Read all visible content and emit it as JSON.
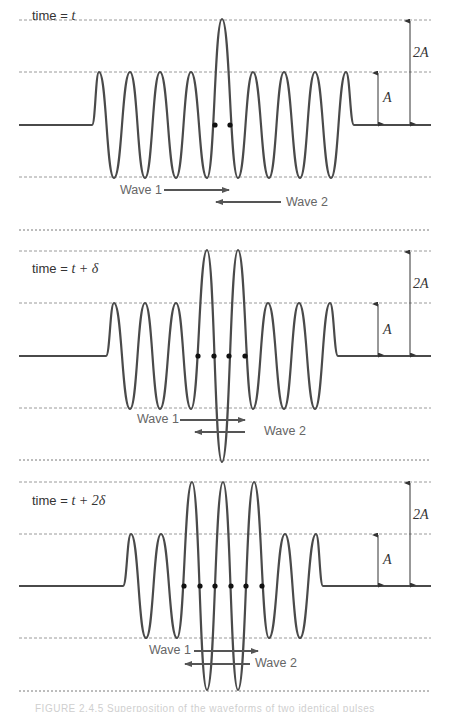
{
  "figure": {
    "colors": {
      "wave": "#4a4a4a",
      "dashed": "#9a9a9a",
      "separator": "#7a7a7a",
      "arrow": "#555555",
      "dot": "#111111",
      "dim": "#333333"
    },
    "x_left": 19,
    "x_right": 431,
    "dim_arrow_A_x": 378,
    "dim_arrow_2A_x": 410,
    "separators_y": [
      230
    ],
    "caption": "FIGURE 2.4.5 Superposition of the waveforms of two identical pulses"
  },
  "panels": [
    {
      "id": "panel-1",
      "time_prefix": "time = ",
      "time_math": "t",
      "time_label_pos": [
        32,
        8
      ],
      "lines_y": {
        "plus2A": 20,
        "plusA": 72,
        "base": 125,
        "minusA": 177,
        "minus2A": null
      },
      "wave_start": 92,
      "wave_end": 354,
      "extrema": [
        [
          99,
          1
        ],
        [
          114,
          -1
        ],
        [
          130,
          1
        ],
        [
          145,
          -1
        ],
        [
          160,
          1
        ],
        [
          176,
          -1
        ],
        [
          191,
          1
        ],
        [
          207,
          -1
        ],
        [
          222,
          2
        ],
        [
          238,
          -1
        ],
        [
          253,
          1
        ],
        [
          269,
          -1
        ],
        [
          284,
          1
        ],
        [
          300,
          -1
        ],
        [
          315,
          1
        ],
        [
          331,
          -1
        ],
        [
          346,
          1
        ]
      ],
      "dots_x": [
        215,
        230
      ],
      "wave1": {
        "label": "Wave 1",
        "label_pos": [
          120,
          183
        ],
        "arrow": [
          164,
          229,
          190
        ]
      },
      "wave2": {
        "label": "Wave 2",
        "label_pos": [
          286,
          195
        ],
        "arrow": [
          281,
          216,
          202
        ]
      },
      "dim_labels": {
        "A": "A",
        "A_pos": [
          383,
          90
        ],
        "twoA": "2A",
        "twoA_pos": [
          413,
          45
        ]
      }
    },
    {
      "id": "panel-2",
      "time_prefix": "time = ",
      "time_math": "t + δ",
      "time_label_pos": [
        32,
        261
      ],
      "lines_y": {
        "plus2A": 251,
        "plusA": 303,
        "base": 356,
        "minusA": 408,
        "minus2A": 460
      },
      "wave_start": 106,
      "wave_end": 338,
      "extrema": [
        [
          114,
          1
        ],
        [
          130,
          -1
        ],
        [
          145,
          1
        ],
        [
          160,
          -1
        ],
        [
          176,
          1
        ],
        [
          191,
          -1
        ],
        [
          207,
          2
        ],
        [
          222,
          -2
        ],
        [
          238,
          2
        ],
        [
          253,
          -1
        ],
        [
          268,
          1
        ],
        [
          284,
          -1
        ],
        [
          299,
          1
        ],
        [
          315,
          -1
        ],
        [
          330,
          1
        ]
      ],
      "dots_x": [
        198,
        214,
        229,
        245
      ],
      "wave1": {
        "label": "Wave 1",
        "label_pos": [
          137,
          412
        ],
        "arrow": [
          180,
          245,
          420
        ]
      },
      "wave2": {
        "label": "Wave 2",
        "label_pos": [
          264,
          424
        ],
        "arrow": [
          245,
          195,
          432
        ]
      },
      "dim_labels": {
        "A": "A",
        "A_pos": [
          383,
          322
        ],
        "twoA": "2A",
        "twoA_pos": [
          413,
          276
        ]
      }
    },
    {
      "id": "panel-3",
      "time_prefix": "time = ",
      "time_math": "t + 2δ",
      "time_label_pos": [
        32,
        493
      ],
      "lines_y": {
        "plus2A": 482,
        "plusA": 534,
        "base": 586,
        "minusA": 638,
        "minus2A": 691
      },
      "wave_start": 123,
      "wave_end": 323,
      "extrema": [
        [
          131,
          1
        ],
        [
          146,
          -1
        ],
        [
          161,
          1
        ],
        [
          177,
          -1
        ],
        [
          192,
          2
        ],
        [
          207,
          -2
        ],
        [
          223,
          2
        ],
        [
          238,
          -2
        ],
        [
          254,
          2
        ],
        [
          269,
          -1
        ],
        [
          285,
          1
        ],
        [
          300,
          -1
        ],
        [
          316,
          1
        ]
      ],
      "dots_x": [
        184,
        200,
        215,
        231,
        246,
        262
      ],
      "wave1": {
        "label": "Wave 1",
        "label_pos": [
          149,
          643
        ],
        "arrow": [
          194,
          258,
          651
        ]
      },
      "wave2": {
        "label": "Wave 2",
        "label_pos": [
          255,
          656
        ],
        "arrow": [
          250,
          185,
          664
        ]
      },
      "dim_labels": {
        "A": "A",
        "A_pos": [
          383,
          552
        ],
        "twoA": "2A",
        "twoA_pos": [
          413,
          507
        ]
      }
    }
  ]
}
